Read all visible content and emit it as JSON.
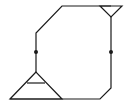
{
  "diagram": {
    "type": "line-drawing",
    "stroke_color": "#1a1a1a",
    "background": "#ffffff",
    "stroke_width": 1.2,
    "outline_path": "M36,72 L36,33 L62,6 L111,6 M111,17 L111,88 L100,99 L10,99",
    "top_right_triangle": {
      "points": "100,6 122,6 111,17"
    },
    "bottom_left_triangle": {
      "points": "36,72 10,99 62,99",
      "inner_line": {
        "x1": 27,
        "y1": 83,
        "x2": 45,
        "y2": 83
      }
    },
    "junction_dots": [
      {
        "name": "left-junction-dot",
        "cx": 36,
        "cy": 52,
        "r": 2
      },
      {
        "name": "right-junction-dot",
        "cx": 111,
        "cy": 52,
        "r": 2
      }
    ]
  }
}
